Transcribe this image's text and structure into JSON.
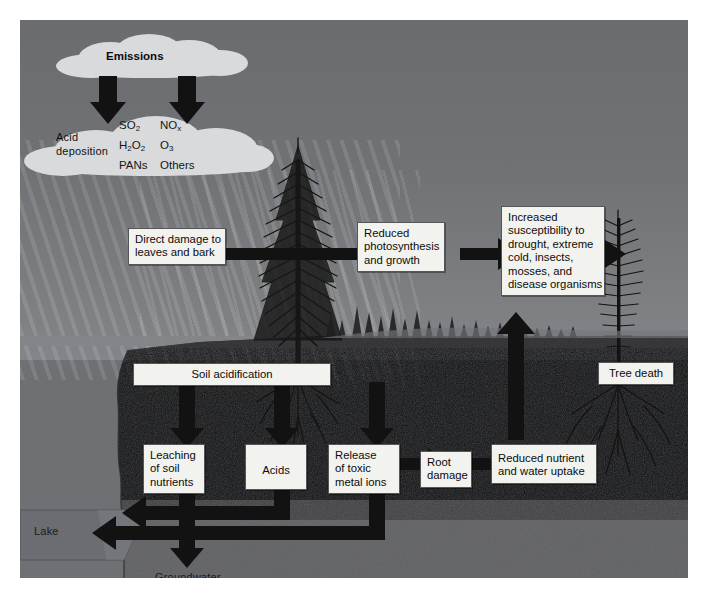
{
  "diagram": {
    "colors": {
      "sky": "#6e7074",
      "cloud": "#d8dadb",
      "topsoil": "#4a4a4c",
      "subsoil": "#7b7b7d",
      "lake": "#6b6d72",
      "box_fill": "#f2f2ee",
      "box_border": "#55555a",
      "arrow": "#121212"
    }
  },
  "atmosphere": {
    "emissions_label": "Emissions",
    "deposition_label_line1": "Acid",
    "deposition_label_line2": "deposition",
    "pollutants_left": [
      "SO2",
      "H2O2",
      "PANs"
    ],
    "pollutants_right": [
      "NOx",
      "O3",
      "Others"
    ]
  },
  "boxes": {
    "direct_damage": {
      "lines": [
        "Direct damage to",
        "leaves and bark"
      ]
    },
    "reduced_photosynthesis": {
      "lines": [
        "Reduced",
        "photosynthesis",
        "and growth"
      ]
    },
    "increased_susceptibility": {
      "lines": [
        "Increased",
        "susceptibility to",
        "drought, extreme",
        "cold, insects,",
        "mosses, and",
        "disease organisms"
      ]
    },
    "tree_death": {
      "lines": [
        "Tree death"
      ]
    },
    "soil_acidification": {
      "lines": [
        "Soil acidification"
      ]
    },
    "leaching": {
      "lines": [
        "Leaching",
        "of soil",
        "nutrients"
      ]
    },
    "acids": {
      "lines": [
        "Acids"
      ]
    },
    "toxic_metals": {
      "lines": [
        "Release",
        "of toxic",
        "metal ions"
      ]
    },
    "root_damage": {
      "lines": [
        "Root",
        "damage"
      ]
    },
    "reduced_uptake": {
      "lines": [
        "Reduced nutrient",
        "and water uptake"
      ]
    }
  },
  "ground_labels": {
    "lake": "Lake",
    "groundwater": "Groundwater"
  },
  "flows": [
    {
      "from": "emissions-cloud",
      "to": "deposition-cloud-left"
    },
    {
      "from": "emissions-cloud",
      "to": "deposition-cloud-right"
    },
    {
      "from": "direct_damage",
      "to": "reduced_photosynthesis"
    },
    {
      "from": "reduced_photosynthesis",
      "to": "increased_susceptibility"
    },
    {
      "from": "increased_susceptibility",
      "to": "tree_death"
    },
    {
      "from": "soil_acidification",
      "to": "leaching"
    },
    {
      "from": "soil_acidification",
      "to": "acids"
    },
    {
      "from": "soil_acidification",
      "to": "toxic_metals"
    },
    {
      "from": "toxic_metals",
      "to": "root_damage"
    },
    {
      "from": "root_damage",
      "to": "reduced_uptake"
    },
    {
      "from": "reduced_uptake",
      "to": "increased_susceptibility"
    },
    {
      "from": "leaching",
      "to": "groundwater"
    },
    {
      "from": "acids",
      "to": "lake"
    },
    {
      "from": "toxic_metals",
      "to": "lake"
    }
  ]
}
